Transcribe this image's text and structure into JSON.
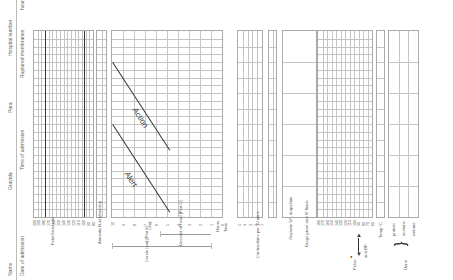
{
  "orientation": "rotated-90-ccw",
  "header": {
    "row1": [
      "Name",
      "Gravida",
      "Para",
      "Hospital number"
    ],
    "row2": [
      "Date of admission",
      "Time of admission",
      "Ruptured membranes",
      "hours"
    ]
  },
  "sections": {
    "fhr": {
      "label": "Fetal heart rate",
      "ticks": [
        "200",
        "190",
        "180",
        "170",
        "160",
        "150",
        "140",
        "130",
        "120",
        "110",
        "100",
        "90",
        "80"
      ]
    },
    "amniotic": {
      "label": "Amniotic fluid Moulding"
    },
    "cervix": {
      "ticks": [
        "10",
        "9",
        "8",
        "7",
        "6",
        "5",
        "4",
        "3",
        "2",
        "1",
        "0"
      ],
      "unit_label": "(cm)",
      "cervix_label": "Cervix (cm) [Plot X]",
      "descent_label": "Descent of head [Plot O]",
      "hours_label": "Hours",
      "time_label": "Time",
      "alert_label": "Alert",
      "action_label": "Action"
    },
    "contractions": {
      "label": "Contractions per 10 mins",
      "ticks": [
        "5",
        "4",
        "3",
        "2",
        "1"
      ]
    },
    "oxytocin": {
      "label": "Oxytocin U/L drops/min"
    },
    "drugs": {
      "label": "Drugs given and IV fluids"
    },
    "pulse_bp": {
      "pulse_label": "Pulse",
      "bp_label": "and BP",
      "ticks": [
        "180",
        "170",
        "160",
        "150",
        "140",
        "130",
        "120",
        "110",
        "100",
        "90",
        "80",
        "70",
        "60"
      ]
    },
    "temp": {
      "label": "Temp °C"
    },
    "urine": {
      "label": "Urine",
      "rows": [
        "protein",
        "acetone",
        "volume"
      ]
    }
  },
  "colors": {
    "grid": "#c4c4c4",
    "border": "#aaaaaa",
    "line_dark": "#333333",
    "text": "#555555"
  },
  "grid": {
    "columns": 24
  }
}
